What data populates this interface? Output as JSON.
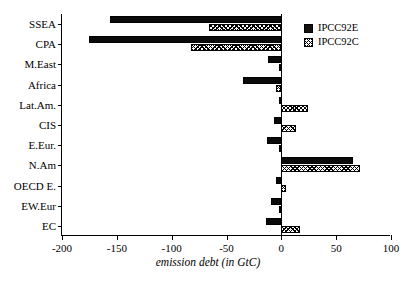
{
  "chart_data": {
    "type": "bar",
    "orientation": "horizontal",
    "title": "",
    "xlabel": "emission debt (in GtC)",
    "ylabel": "",
    "xlim": [
      -200,
      100
    ],
    "ylim": null,
    "grid": false,
    "legend_position": "top-right",
    "xticks": [
      -200,
      -150,
      -100,
      -50,
      0,
      50,
      100
    ],
    "xticklabels": [
      "-200",
      "-150",
      "-100",
      "-50",
      "0",
      "50",
      "100"
    ],
    "categories": [
      "SSEA",
      "CPA",
      "M.East",
      "Africa",
      "Lat.Am.",
      "CIS",
      "E.Eur.",
      "N.Am",
      "OECD E.",
      "EW.Eur",
      "EC"
    ],
    "series": [
      {
        "name": "IPCC92E",
        "style": "solid-black",
        "color": "#111111",
        "values": [
          -156,
          -175,
          -12,
          -35,
          -2,
          -7,
          -13,
          65,
          -5,
          -9,
          -14
        ]
      },
      {
        "name": "IPCC92C",
        "style": "hatched",
        "color": "#ffffff",
        "values": [
          -66,
          -82,
          -2,
          -5,
          24,
          13,
          -2,
          72,
          4,
          -2,
          17
        ]
      }
    ]
  },
  "legend": {
    "entries": [
      {
        "label": "IPCC92E",
        "swatch": "solid-black-swatch"
      },
      {
        "label": "IPCC92C",
        "swatch": "hatched-swatch"
      }
    ]
  }
}
